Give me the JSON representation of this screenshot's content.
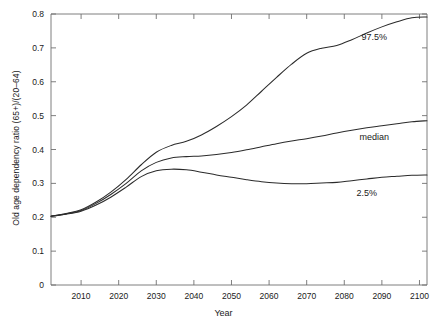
{
  "chart_data": {
    "type": "line",
    "title": "",
    "xlabel": "Year",
    "ylabel": "Old age dependency ratio (65+)/(20–64)",
    "xlim": [
      2002,
      2102
    ],
    "ylim": [
      0,
      0.8
    ],
    "grid": false,
    "legend_position": "inline-annotations",
    "xticks": [
      2010,
      2020,
      2030,
      2040,
      2050,
      2060,
      2070,
      2080,
      2090,
      2100
    ],
    "xtick_labels": [
      "2010",
      "2020",
      "2030",
      "2040",
      "2050",
      "2060",
      "2070",
      "2080",
      "2090",
      "2100"
    ],
    "yticks": [
      0,
      0.1,
      0.2,
      0.3,
      0.4,
      0.5,
      0.6,
      0.7,
      0.8
    ],
    "ytick_labels": [
      "0",
      "0.1",
      "0.2",
      "0.3",
      "0.4",
      "0.5",
      "0.6",
      "0.7",
      "0.8"
    ],
    "x": [
      2002,
      2006,
      2010,
      2014,
      2018,
      2022,
      2026,
      2030,
      2034,
      2038,
      2042,
      2046,
      2050,
      2054,
      2058,
      2062,
      2066,
      2070,
      2074,
      2078,
      2082,
      2086,
      2090,
      2094,
      2098,
      2102
    ],
    "series": [
      {
        "name": "97.5%",
        "label": "97.5%",
        "values": [
          0.203,
          0.211,
          0.222,
          0.245,
          0.275,
          0.312,
          0.355,
          0.392,
          0.412,
          0.424,
          0.443,
          0.468,
          0.497,
          0.531,
          0.572,
          0.613,
          0.652,
          0.684,
          0.699,
          0.707,
          0.724,
          0.744,
          0.762,
          0.777,
          0.789,
          0.791
        ],
        "label_x": 2088,
        "label_y": 0.722
      },
      {
        "name": "median",
        "label": "median",
        "values": [
          0.203,
          0.21,
          0.22,
          0.241,
          0.268,
          0.3,
          0.337,
          0.362,
          0.375,
          0.379,
          0.381,
          0.385,
          0.391,
          0.399,
          0.408,
          0.417,
          0.425,
          0.432,
          0.44,
          0.449,
          0.457,
          0.464,
          0.47,
          0.476,
          0.482,
          0.485
        ],
        "label_x": 2088,
        "label_y": 0.428
      },
      {
        "name": "2.5%",
        "label": "2.5%",
        "values": [
          0.203,
          0.209,
          0.218,
          0.236,
          0.26,
          0.289,
          0.32,
          0.337,
          0.342,
          0.34,
          0.333,
          0.325,
          0.318,
          0.311,
          0.305,
          0.301,
          0.299,
          0.299,
          0.301,
          0.303,
          0.308,
          0.313,
          0.318,
          0.321,
          0.324,
          0.325
        ],
        "label_x": 2086,
        "label_y": 0.262
      }
    ]
  }
}
